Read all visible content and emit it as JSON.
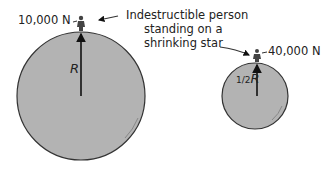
{
  "colors": {
    "sphere_fill": "#b3b3b3",
    "outline": "#333333",
    "text": "#222222"
  },
  "large_star": {
    "force_label": "10,000 N",
    "radius_label": "R"
  },
  "small_star": {
    "force_label": "40,000 N",
    "radius_label_frac": "1/2",
    "radius_label_var": "R"
  },
  "caption": {
    "line1": "Indestructible person",
    "line2": "standing on a",
    "line3": "shrinking star"
  }
}
